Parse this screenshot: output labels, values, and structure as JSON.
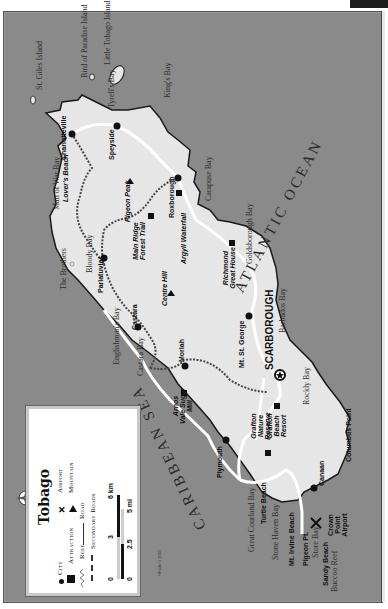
{
  "map": {
    "title": "Tobago",
    "orientation": "rotated 90° counter-clockwise (north points left)",
    "colors": {
      "sea": "#8a8a8a",
      "land": "#e6e6e6",
      "coast": "#1a1a1a",
      "road": "#ffffff",
      "secondary_road": "#555555"
    },
    "oceans": {
      "atlantic": "ATLANTIC OCEAN",
      "caribbean": "CARIBBEAN SEA"
    },
    "capital": "SCARBOROUGH",
    "cities": [
      "Charlotteville",
      "Speyside",
      "Roxborough",
      "Parlatuvier",
      "Castara",
      "Moriah",
      "Mt. St. George",
      "Plymouth",
      "Canaan"
    ],
    "attractions": [
      "Lover's Beach",
      "Main Ridge Forest Trail",
      "Argyll Waterfall",
      "Richmond Great House",
      "Arnos Vale Sugar Mill",
      "Grafton Nature Reserve",
      "Grafton Beach Resort",
      "Turtle Beach",
      "Mt. Irvine Beach",
      "Pigeon Pt.",
      "Sandy Beach",
      "Columbus Point"
    ],
    "mountains": [
      "Pigeon Peak",
      "Centre Hill"
    ],
    "airport": "Crown Point Airport",
    "water_features": [
      "St. Giles Island",
      "Bird of Paradise Island",
      "Little Tobago Island",
      "Tyrell's Bay",
      "King's Bay",
      "Man of War Bay",
      "The Brothers",
      "Bloody Bay",
      "Englishman's Bay",
      "Castara Bay",
      "Great Courland Bay",
      "Stone Haven Bay",
      "Store Bay",
      "Buccoo Reef",
      "Rockly Bay",
      "Barbados Bay",
      "Goldsborough Bay",
      "Carapuse Bay"
    ]
  },
  "labels": {
    "st_giles": "St. Giles Island",
    "bird_paradise": "Bird of Paradise Island",
    "little_tobago": "Little Tobago Island",
    "tyrells": "Tyrell's Bay",
    "kings": "King's Bay",
    "man_of_war": "Man of War Bay",
    "brothers": "The Brothers",
    "bloody": "Bloody Bay",
    "englishmans": "Englishman's Bay",
    "castara_bay": "Castara Bay",
    "great_courland": "Great Courland Bay",
    "stone_haven": "Stone Haven Bay",
    "store_bay": "Store Bay",
    "buccoo": "Buccoo Reef",
    "rockly": "Rockly Bay",
    "barbados": "Barbados Bay",
    "goldsborough": "Goldsborough Bay",
    "carapuse": "Carapuse Bay",
    "atlantic": "ATLANTIC OCEAN",
    "caribbean": "CARIBBEAN SEA",
    "charlotteville": "Charlotteville",
    "speyside": "Speyside",
    "roxborough": "Roxborough",
    "parlatuvier": "Parlatuvier",
    "castara": "Castara",
    "moriah": "Moriah",
    "mt_st_george": "Mt. St. George",
    "plymouth": "Plymouth",
    "canaan": "Canaan",
    "scarborough": "SCARBOROUGH",
    "lovers_beach": "Lover's Beach",
    "pigeon_peak": "Pigeon Peak",
    "centre_hill": "Centre Hill",
    "main_ridge": "Main Ridge Forest Trail",
    "argyll": "Argyll Waterfall",
    "richmond": "Richmond Great House",
    "arnos_vale": "Arnos Vale Sugar Mill",
    "grafton_nature": "Grafton Nature Reserve",
    "grafton_beach": "Grafton Beach Resort",
    "turtle_beach": "Turtle Beach",
    "mt_irvine": "Mt. Irvine Beach",
    "pigeon_pt": "Pigeon Pt.",
    "sandy_beach": "Sandy Beach",
    "crown_point": "Crown Point Airport",
    "columbus_point": "Columbus Point"
  },
  "legend": {
    "title": "Tobago",
    "items": {
      "city": "City",
      "airport": "Airport",
      "attraction": "Attraction",
      "mountain": "Mountain",
      "reef": "Reef",
      "road": "Road",
      "secondary_roads": "Secondary Roads"
    },
    "scale": {
      "km_0": "0",
      "km_mid": "3",
      "km_max": "6 km",
      "mi_0": "0",
      "mi_mid": "2.5",
      "mi_max": "5 mi"
    },
    "credit": "©Fodor's 2005"
  }
}
